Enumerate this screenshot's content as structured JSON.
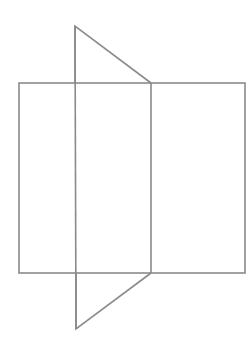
{
  "diagram": {
    "stroke_color": "#8a8a8a",
    "stroke_width": 1.6,
    "background": "#ffffff",
    "rectangle": {
      "x": 19,
      "y": 83,
      "width": 226,
      "height": 190
    },
    "divider_line": {
      "x1": 151,
      "y1": 83,
      "x2": 151,
      "y2": 273
    },
    "left_vertical_line": {
      "x1": 75,
      "y1": 26,
      "x2": 76,
      "y2": 329
    },
    "top_triangle": {
      "points": "75,26 151,83 75,83"
    },
    "bottom_triangle": {
      "points": "76,273 151,273 76,329"
    }
  }
}
